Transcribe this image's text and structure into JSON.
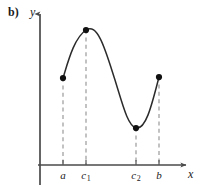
{
  "figure": {
    "panel_label": "b)",
    "y_axis_label": "y",
    "x_axis_label": "x",
    "background_color": "#ffffff",
    "curve_color": "#2b2b2b",
    "axis_color": "#4a4a4a",
    "dash_color": "#9a9a9a",
    "point_color": "#111111"
  },
  "chart_data": {
    "type": "line",
    "title": "",
    "subtitle": "",
    "xlabel": "x",
    "ylabel": "y",
    "panel": "b)",
    "grid": false,
    "legend": null,
    "axes": {
      "x_axis_y_px": 165,
      "y_axis_x_px": 40,
      "x_axis_start_px": 38,
      "x_axis_end_px": 188,
      "y_axis_top_px": 12,
      "y_axis_bottom_px": 185,
      "arrows": [
        "x-right",
        "y-up"
      ]
    },
    "xticks": [
      {
        "label": "a",
        "sub": "",
        "x_px": 63
      },
      {
        "label": "c",
        "sub": "1",
        "x_px": 86
      },
      {
        "label": "c",
        "sub": "2",
        "x_px": 136
      },
      {
        "label": "b",
        "sub": "",
        "x_px": 159
      }
    ],
    "points": [
      {
        "name": "a",
        "x_px": 63,
        "y_px": 78,
        "role": "left-endpoint"
      },
      {
        "name": "c1",
        "x_px": 86,
        "y_px": 30,
        "role": "local-maximum"
      },
      {
        "name": "c2",
        "x_px": 136,
        "y_px": 128,
        "role": "local-minimum"
      },
      {
        "name": "b",
        "x_px": 159,
        "y_px": 77,
        "role": "right-endpoint"
      }
    ],
    "curve_path": "M 63,78 C 68,62 74,38 86,30 C 98,22 106,52 115,80 C 123,106 128,126 136,128 C 146,130 152,104 159,77",
    "dashed_drops": [
      {
        "name": "a",
        "x_px": 63,
        "from_y_px": 78,
        "to_y_px": 165
      },
      {
        "name": "c1",
        "x_px": 86,
        "from_y_px": 30,
        "to_y_px": 165
      },
      {
        "name": "c2",
        "x_px": 136,
        "from_y_px": 128,
        "to_y_px": 165
      },
      {
        "name": "b",
        "x_px": 159,
        "from_y_px": 77,
        "to_y_px": 165
      }
    ]
  }
}
